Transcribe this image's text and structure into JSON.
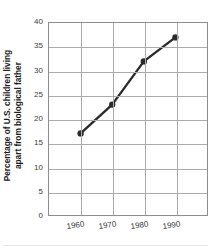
{
  "chart_data": {
    "type": "line",
    "title": "",
    "xlabel": "",
    "ylabel": "Percentage of U.S. children living apart from biological father",
    "ylabel_lines": [
      "Percentage of U.S. children living",
      "apart from biological father"
    ],
    "categories": [
      "1960",
      "1970",
      "1980",
      "1990"
    ],
    "x": [
      1960,
      1970,
      1980,
      1990
    ],
    "values": [
      17,
      23,
      32,
      37
    ],
    "series": [
      {
        "name": "Percentage of U.S. children living apart from biological father",
        "values": [
          17,
          23,
          32,
          37
        ]
      }
    ],
    "ylim": [
      0,
      40
    ],
    "ytick_labels": [
      "0",
      "5",
      "10",
      "15",
      "20",
      "25",
      "30",
      "35",
      "40"
    ],
    "yticks": [
      0,
      5,
      10,
      15,
      20,
      25,
      30,
      35,
      40
    ],
    "xtick_labels": [
      "1960",
      "1970",
      "1980",
      "1990"
    ],
    "grid": true,
    "legend": "none",
    "marker": "circle",
    "line_color": "#2b2b2b",
    "marker_color": "#2b2b2b",
    "grid_color": "#a9a9b0",
    "axis_color": "#8c8c93",
    "text_color": "#1a1a1a",
    "tick_text_color": "#3a3a3a",
    "background_color": "#ffffff"
  }
}
